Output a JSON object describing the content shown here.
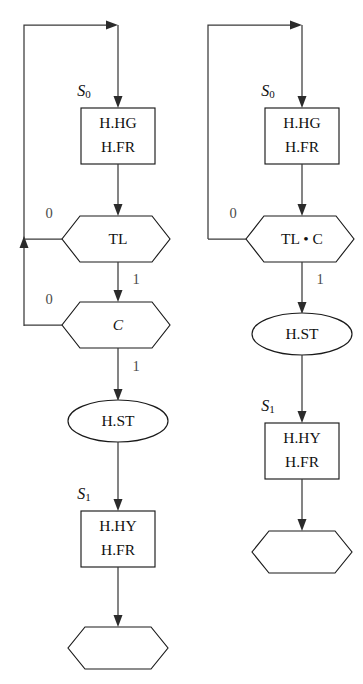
{
  "figure": {
    "type": "flowchart-pair",
    "background_color": "#ffffff",
    "line_color": "#3a3a3a",
    "shape_stroke_color": "#1a1a1a",
    "label_color": "#111111",
    "branch_label_color": "#4a4a4a"
  },
  "charts": [
    {
      "id": "left-flowchart",
      "name": "unfactored-state-machine",
      "nodes": [
        {
          "id": "L-state0-label",
          "name": "state-label-s0",
          "shape": "text",
          "text": "S",
          "subscript": "0",
          "x": 84,
          "y": 92
        },
        {
          "id": "L-action0",
          "name": "action-box-hg-fr",
          "shape": "rect",
          "lines": [
            "H.HG",
            "H.FR"
          ],
          "x": 81,
          "y": 108,
          "w": 74,
          "h": 56
        },
        {
          "id": "L-decision-tl",
          "name": "decision-hexagon-tl",
          "shape": "hexagon",
          "lines": [
            "TL"
          ],
          "x": 62,
          "y": 216,
          "w": 108,
          "h": 46
        },
        {
          "id": "L-decision-c",
          "name": "decision-hexagon-c",
          "shape": "hexagon",
          "lines": [
            "C"
          ],
          "italic": true,
          "x": 62,
          "y": 302,
          "w": 108,
          "h": 46
        },
        {
          "id": "L-action-st",
          "name": "action-ellipse-st",
          "shape": "ellipse",
          "lines": [
            "H.ST"
          ],
          "x": 68,
          "y": 400,
          "w": 100,
          "h": 42
        },
        {
          "id": "L-state1-label",
          "name": "state-label-s1",
          "shape": "text",
          "text": "S",
          "subscript": "1",
          "x": 84,
          "y": 495
        },
        {
          "id": "L-action1",
          "name": "action-box-hy-fr",
          "shape": "rect",
          "lines": [
            "H.HY",
            "H.FR"
          ],
          "x": 81,
          "y": 511,
          "w": 74,
          "h": 56
        },
        {
          "id": "L-terminal",
          "name": "terminal-hexagon-empty",
          "shape": "hexagon",
          "lines": [],
          "x": 68,
          "y": 627,
          "w": 100,
          "h": 42
        }
      ],
      "edges": [
        {
          "id": "L-e-entry",
          "name": "edge-entry-to-action0",
          "from": "loop-top",
          "to": "L-action0",
          "label": ""
        },
        {
          "id": "L-e-action0-tl",
          "name": "edge-action0-to-tl",
          "from": "L-action0",
          "to": "L-decision-tl",
          "label": ""
        },
        {
          "id": "L-e-tl-0",
          "name": "edge-tl-false-to-loop",
          "from": "L-decision-tl",
          "to": "loop-left",
          "label": "0",
          "label_x": 49,
          "label_y": 215
        },
        {
          "id": "L-e-tl-1",
          "name": "edge-tl-true-to-c",
          "from": "L-decision-tl",
          "to": "L-decision-c",
          "label": "1",
          "label_x": 136,
          "label_y": 281
        },
        {
          "id": "L-e-c-0",
          "name": "edge-c-false-to-loop",
          "from": "L-decision-c",
          "to": "loop-left",
          "label": "0",
          "label_x": 49,
          "label_y": 301
        },
        {
          "id": "L-e-c-1",
          "name": "edge-c-true-to-st",
          "from": "L-decision-c",
          "to": "L-action-st",
          "label": "1",
          "label_x": 136,
          "label_y": 368
        },
        {
          "id": "L-e-st-action1",
          "name": "edge-st-to-action1",
          "from": "L-action-st",
          "to": "L-action1",
          "label": ""
        },
        {
          "id": "L-e-action1-terminal",
          "name": "edge-action1-to-terminal",
          "from": "L-action1",
          "to": "L-terminal",
          "label": ""
        }
      ]
    },
    {
      "id": "right-flowchart",
      "name": "factored-state-machine",
      "nodes": [
        {
          "id": "R-state0-label",
          "name": "state-label-s0",
          "shape": "text",
          "text": "S",
          "subscript": "0",
          "x": 268,
          "y": 92
        },
        {
          "id": "R-action0",
          "name": "action-box-hg-fr",
          "shape": "rect",
          "lines": [
            "H.HG",
            "H.FR"
          ],
          "x": 265,
          "y": 108,
          "w": 74,
          "h": 56
        },
        {
          "id": "R-decision-tlc",
          "name": "decision-hexagon-tl-and-c",
          "shape": "hexagon",
          "lines": [
            "TL • C"
          ],
          "x": 246,
          "y": 216,
          "w": 108,
          "h": 46
        },
        {
          "id": "R-action-st",
          "name": "action-ellipse-st",
          "shape": "ellipse",
          "lines": [
            "H.ST"
          ],
          "x": 252,
          "y": 313,
          "w": 100,
          "h": 42
        },
        {
          "id": "R-state1-label",
          "name": "state-label-s1",
          "shape": "text",
          "text": "S",
          "subscript": "1",
          "x": 268,
          "y": 407
        },
        {
          "id": "R-action1",
          "name": "action-box-hy-fr",
          "shape": "rect",
          "lines": [
            "H.HY",
            "H.FR"
          ],
          "x": 265,
          "y": 423,
          "w": 74,
          "h": 56
        },
        {
          "id": "R-terminal",
          "name": "terminal-hexagon-empty",
          "shape": "hexagon",
          "lines": [],
          "x": 252,
          "y": 531,
          "w": 100,
          "h": 42
        }
      ],
      "edges": [
        {
          "id": "R-e-entry",
          "name": "edge-entry-to-action0",
          "from": "loop-top",
          "to": "R-action0",
          "label": ""
        },
        {
          "id": "R-e-action0-tlc",
          "name": "edge-action0-to-tlc",
          "from": "R-action0",
          "to": "R-decision-tlc",
          "label": ""
        },
        {
          "id": "R-e-tlc-0",
          "name": "edge-tlc-false-to-loop",
          "from": "R-decision-tlc",
          "to": "loop-left",
          "label": "0",
          "label_x": 233,
          "label_y": 215
        },
        {
          "id": "R-e-tlc-1",
          "name": "edge-tlc-true-to-st",
          "from": "R-decision-tlc",
          "to": "R-action-st",
          "label": "1",
          "label_x": 320,
          "label_y": 281
        },
        {
          "id": "R-e-st-action1",
          "name": "edge-st-to-action1",
          "from": "R-action-st",
          "to": "R-action1",
          "label": ""
        },
        {
          "id": "R-e-action1-terminal",
          "name": "edge-action1-to-terminal",
          "from": "R-action1",
          "to": "R-terminal",
          "label": ""
        }
      ]
    }
  ]
}
